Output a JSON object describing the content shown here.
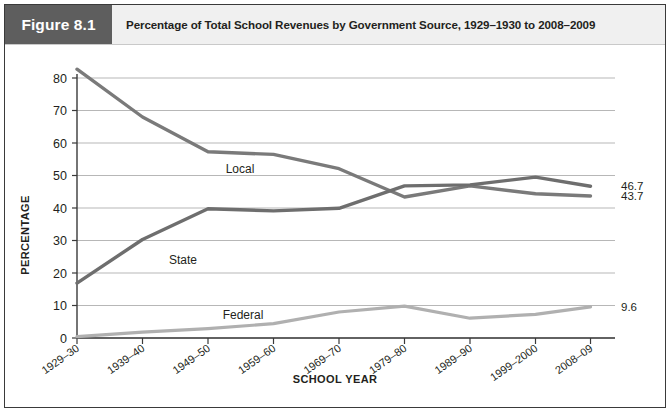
{
  "figure": {
    "tag": "Figure 8.1",
    "caption": "Percentage of Total School Revenues by Government Source, 1929–1930 to 2008–2009",
    "tag_bg": "#5e5e5e",
    "caption_bg": "#f0f0f0",
    "border_color": "#3a3a3a"
  },
  "chart_data": {
    "type": "line",
    "title": "Percentage of Total School Revenues by Government Source, 1929–1930 to 2008–2009",
    "xlabel": "SCHOOL YEAR",
    "ylabel": "PERCENTAGE",
    "categories": [
      "1929–30",
      "1939–40",
      "1949–50",
      "1959–60",
      "1969–70",
      "1979–80",
      "1989–90",
      "1999–2000",
      "2008–09"
    ],
    "ylim": [
      0,
      80
    ],
    "yticks": [
      0,
      10,
      20,
      30,
      40,
      50,
      60,
      70,
      80
    ],
    "grid": true,
    "legend": "inline-labels",
    "series": [
      {
        "name": "Local",
        "color": "#7a7a7a",
        "values": [
          82.7,
          68.0,
          57.3,
          56.5,
          52.1,
          43.4,
          46.8,
          44.4,
          43.7
        ],
        "end_label": "43.7",
        "inline_label": "Local"
      },
      {
        "name": "State",
        "color": "#6e6e6e",
        "values": [
          16.9,
          30.3,
          39.8,
          39.1,
          39.9,
          46.8,
          47.1,
          49.5,
          46.7
        ],
        "end_label": "46.7",
        "inline_label": "State"
      },
      {
        "name": "Federal",
        "color": "#b0b0b0",
        "values": [
          0.4,
          1.8,
          2.9,
          4.4,
          8.0,
          9.8,
          6.1,
          7.3,
          9.6
        ],
        "end_label": "9.6",
        "inline_label": "Federal"
      }
    ]
  }
}
